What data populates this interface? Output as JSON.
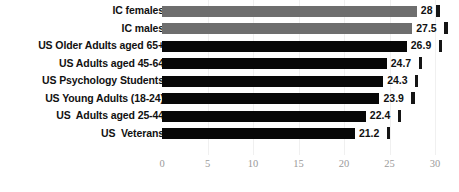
{
  "chart_data": {
    "type": "bar",
    "orientation": "horizontal",
    "title": "",
    "xlabel": "",
    "ylabel": "",
    "xlim": [
      0,
      30
    ],
    "xticks": [
      0,
      5,
      10,
      15,
      20,
      25,
      30
    ],
    "grid": true,
    "legend": null,
    "categories": [
      "IC females",
      "IC males",
      "US Older Adults aged 65+",
      "US Adults aged 45-64",
      "US Psychology Students",
      "US Young Adults (18-24)",
      "US  Adults aged 25-44",
      "US  Veterans"
    ],
    "values": [
      28,
      27.5,
      26.9,
      24.7,
      24.3,
      23.9,
      22.4,
      21.2
    ],
    "value_labels": [
      "28",
      "27.5",
      "26.9",
      "24.7",
      "24.3",
      "23.9",
      "22.4",
      "21.2"
    ],
    "bar_colors": [
      "#6e6e6e",
      "#6e6e6e",
      "#080808",
      "#080808",
      "#080808",
      "#080808",
      "#080808",
      "#080808"
    ],
    "error_bars": true,
    "colors": {
      "gray_series": "#6e6e6e",
      "black_series": "#080808",
      "tick_label": "#9a9a9a",
      "category_label": "#111111",
      "gridline": "#f0f0f0",
      "background": "#ffffff"
    }
  }
}
